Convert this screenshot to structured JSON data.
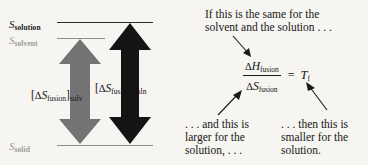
{
  "figure": {
    "background_color": "#f6f5f1",
    "ink_color": "#1a1a1a",
    "gray_color": "#737373",
    "level_gray_color": "#9a9a9a"
  },
  "diagram": {
    "levels": [
      {
        "id": "solution",
        "symbol": "S",
        "subscript": "solution",
        "tone": "dark"
      },
      {
        "id": "solvent",
        "symbol": "S",
        "subscript": "solvent",
        "tone": "mid"
      },
      {
        "id": "solid",
        "symbol": "S",
        "subscript": "solid",
        "tone": "mid"
      }
    ],
    "arrows": [
      {
        "id": "solvent-fusion",
        "color": "#737373",
        "label": {
          "open": "[",
          "delta": "Δ",
          "symbol": "S",
          "sub1": "fusion",
          "close": "]",
          "sub2": "solv"
        }
      },
      {
        "id": "solution-fusion",
        "color": "#141414",
        "label": {
          "open": "[",
          "delta": "Δ",
          "symbol": "S",
          "sub1": "fusion",
          "close": "]",
          "sub2": "soln"
        }
      }
    ]
  },
  "annotations": {
    "top": {
      "line1": "If this is the same for the",
      "line2": "solvent and the solution . . ."
    },
    "bottom_left": {
      "line1": ". . . and this is",
      "line2": "larger for the",
      "line3": "solution, . . ."
    },
    "bottom_right": {
      "line1": ". . . then this is",
      "line2": "smaller for the",
      "line3": "solution."
    }
  },
  "equation": {
    "numerator": {
      "delta": "Δ",
      "symbol": "H",
      "sub": "fusion"
    },
    "denominator": {
      "delta": "Δ",
      "symbol": "S",
      "sub": "fusion"
    },
    "equals": "=",
    "result": {
      "symbol": "T",
      "sub": "f"
    }
  }
}
